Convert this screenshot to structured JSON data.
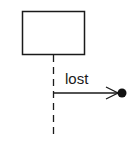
{
  "diagram": {
    "type": "uml-sequence-lost-message",
    "lifeline": {
      "head_label": ""
    },
    "message": {
      "label": "lost",
      "kind": "lost",
      "arrow": "open-arrowhead",
      "endpoint": "filled-circle"
    },
    "colors": {
      "stroke": "#1a1a1a",
      "background": "#ffffff"
    }
  }
}
